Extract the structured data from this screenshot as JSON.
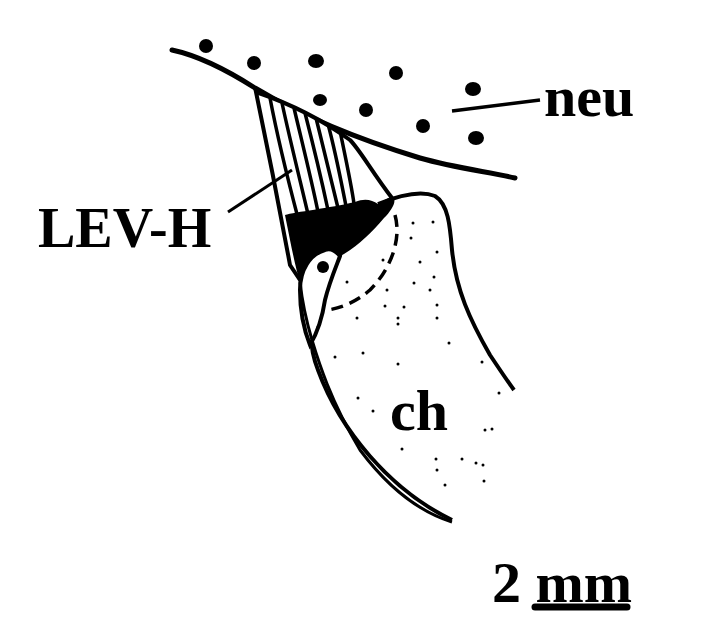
{
  "figure": {
    "type": "anatomical line drawing",
    "labels": {
      "neu": "neu",
      "lev_h": "LEV-H",
      "ch": "ch"
    },
    "scale_bar": {
      "value": "2",
      "unit": "mm",
      "text": "2 mm"
    },
    "colors": {
      "ink": "#000000",
      "background": "#ffffff"
    }
  }
}
